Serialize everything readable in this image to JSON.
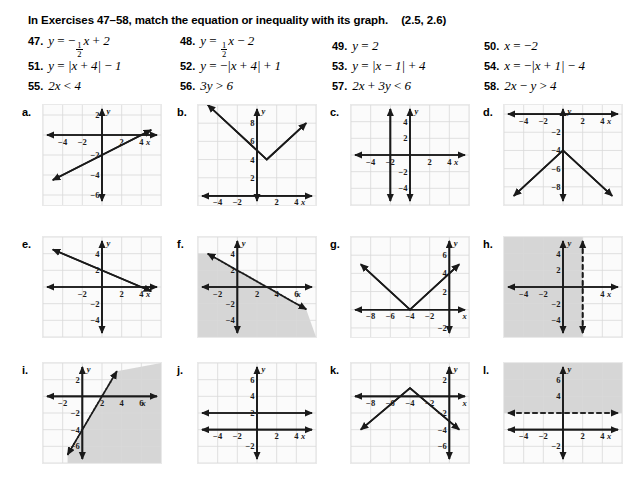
{
  "directions": {
    "text": "In Exercises 47–58, match the equation or inequality with its graph.",
    "reference": "(2.5, 2.6)"
  },
  "exercises": [
    {
      "number": "47.",
      "equation": "y = -(1/2)x + 2",
      "parts": [
        "y",
        "=",
        "-",
        "1/2",
        "x",
        "+",
        "2"
      ]
    },
    {
      "number": "48.",
      "equation": "y = (1/2)x - 2",
      "parts": [
        "y",
        "=",
        "1/2",
        "x",
        "-",
        "2"
      ]
    },
    {
      "number": "49.",
      "equation": "y = 2"
    },
    {
      "number": "50.",
      "equation": "x = -2"
    },
    {
      "number": "51.",
      "equation": "y = |x + 4| - 1"
    },
    {
      "number": "52.",
      "equation": "y = -|x + 4| + 1"
    },
    {
      "number": "53.",
      "equation": "y = |x - 1| + 4"
    },
    {
      "number": "54.",
      "equation": "x = -|x + 1| - 4"
    },
    {
      "number": "55.",
      "equation": "2x < 4"
    },
    {
      "number": "56.",
      "equation": "3y > 6"
    },
    {
      "number": "57.",
      "equation": "2x + 3y < 6"
    },
    {
      "number": "58.",
      "equation": "2x - y > 4"
    }
  ],
  "chart_data": [
    {
      "id": "a",
      "label": "a.",
      "type": "line",
      "title": "",
      "xlabel": "x",
      "ylabel": "y",
      "grid": true,
      "legend": "none",
      "xlim": [
        -6,
        6
      ],
      "ylim": [
        -7,
        3
      ],
      "xticks": [
        -4,
        -2,
        2,
        4
      ],
      "yticks": [
        2,
        -2,
        -4,
        -6
      ],
      "series": [
        {
          "name": "y = (1/2)x - 2",
          "style": "solid",
          "points": [
            [
              -5,
              -4.5
            ],
            [
              5,
              0.5
            ]
          ]
        }
      ]
    },
    {
      "id": "b",
      "label": "b.",
      "type": "line",
      "title": "",
      "xlabel": "x",
      "ylabel": "y",
      "grid": true,
      "legend": "none",
      "xlim": [
        -6,
        6
      ],
      "ylim": [
        -1,
        10
      ],
      "xticks": [
        -4,
        -2,
        2,
        4
      ],
      "yticks": [
        8,
        6,
        4,
        2
      ],
      "series": [
        {
          "name": "y = |x - 1| + 4",
          "style": "solid",
          "vertex": [
            1,
            4
          ],
          "points": [
            [
              -5,
              10
            ],
            [
              1,
              4
            ],
            [
              5,
              8
            ]
          ]
        }
      ]
    },
    {
      "id": "c",
      "label": "c.",
      "type": "line",
      "title": "",
      "xlabel": "x",
      "ylabel": "y",
      "grid": true,
      "legend": "none",
      "xlim": [
        -6,
        6
      ],
      "ylim": [
        -6,
        6
      ],
      "xticks": [
        -4,
        -2,
        2,
        4
      ],
      "yticks": [
        4,
        2,
        -2,
        -4
      ],
      "series": [
        {
          "name": "x = -2",
          "style": "solid",
          "vertical": -2
        }
      ]
    },
    {
      "id": "d",
      "label": "d.",
      "type": "line",
      "title": "",
      "xlabel": "x",
      "ylabel": "y",
      "grid": true,
      "legend": "none",
      "xlim": [
        -6,
        6
      ],
      "ylim": [
        -10,
        1
      ],
      "xticks": [
        -4,
        -2,
        2,
        4
      ],
      "yticks": [
        -2,
        -4,
        -6,
        -8
      ],
      "series": [
        {
          "name": "y = -|x| - 4",
          "style": "solid",
          "vertex": [
            0,
            -4
          ],
          "points": [
            [
              -5,
              -9
            ],
            [
              0,
              -4
            ],
            [
              5,
              -9
            ]
          ]
        }
      ]
    },
    {
      "id": "e",
      "label": "e.",
      "type": "line",
      "title": "",
      "xlabel": "x",
      "ylabel": "y",
      "grid": true,
      "legend": "none",
      "xlim": [
        -6,
        6
      ],
      "ylim": [
        -6,
        6
      ],
      "xticks": [
        -2,
        2,
        4
      ],
      "yticks": [
        4,
        2,
        -2,
        -4
      ],
      "series": [
        {
          "name": "y = -(1/2)x + 2",
          "style": "solid",
          "points": [
            [
              -5,
              4.5
            ],
            [
              5,
              -0.5
            ]
          ]
        }
      ]
    },
    {
      "id": "f",
      "label": "f.",
      "type": "area",
      "title": "",
      "xlabel": "x",
      "ylabel": "y",
      "grid": true,
      "legend": "none",
      "xlim": [
        -4,
        8
      ],
      "ylim": [
        -6,
        6
      ],
      "xticks": [
        -2,
        2,
        4,
        6
      ],
      "yticks": [
        4,
        2,
        -2,
        -4
      ],
      "series": [
        {
          "name": "2x + 3y < 6",
          "style": "dashed",
          "shade": "below-left",
          "points": [
            [
              -3,
              4
            ],
            [
              3,
              0
            ],
            [
              7,
              -2.67
            ]
          ]
        }
      ]
    },
    {
      "id": "g",
      "label": "g.",
      "type": "line",
      "title": "",
      "xlabel": "x",
      "ylabel": "y",
      "grid": true,
      "legend": "none",
      "xlim": [
        -10,
        2
      ],
      "ylim": [
        -3,
        8
      ],
      "xticks": [
        -8,
        -6,
        -4,
        -2
      ],
      "yticks": [
        6,
        4,
        2,
        -2
      ],
      "series": [
        {
          "name": "y = |x + 4|",
          "style": "solid",
          "vertex": [
            -4,
            0
          ],
          "points": [
            [
              -9,
              5
            ],
            [
              -4,
              0
            ],
            [
              1,
              5
            ]
          ]
        }
      ]
    },
    {
      "id": "h",
      "label": "h.",
      "type": "area",
      "title": "",
      "xlabel": "x",
      "ylabel": "y",
      "grid": true,
      "legend": "none",
      "xlim": [
        -6,
        6
      ],
      "ylim": [
        -6,
        6
      ],
      "xticks": [
        -4,
        -2,
        4
      ],
      "yticks": [
        4,
        2,
        -2,
        -4
      ],
      "series": [
        {
          "name": "2x < 4",
          "style": "dashed",
          "vertical": 2,
          "shade": "left"
        }
      ]
    },
    {
      "id": "i",
      "label": "i.",
      "type": "area",
      "title": "",
      "xlabel": "x",
      "ylabel": "y",
      "grid": true,
      "legend": "none",
      "xlim": [
        -4,
        8
      ],
      "ylim": [
        -8,
        4
      ],
      "xticks": [
        -2,
        2,
        4,
        6
      ],
      "yticks": [
        2,
        -2,
        -4,
        -6
      ],
      "series": [
        {
          "name": "2x - y > 4",
          "style": "dashed",
          "shade": "right",
          "points": [
            [
              -1.5,
              -7
            ],
            [
              2,
              0
            ],
            [
              3.5,
              3
            ]
          ]
        }
      ]
    },
    {
      "id": "j",
      "label": "j.",
      "type": "line",
      "title": "",
      "xlabel": "x",
      "ylabel": "y",
      "grid": true,
      "legend": "none",
      "xlim": [
        -6,
        6
      ],
      "ylim": [
        -4,
        8
      ],
      "xticks": [
        -4,
        -2,
        2,
        4
      ],
      "yticks": [
        6,
        4,
        2,
        -2
      ],
      "series": [
        {
          "name": "y = 2",
          "style": "solid",
          "horizontal": 2
        }
      ]
    },
    {
      "id": "k",
      "label": "k.",
      "type": "line",
      "title": "",
      "xlabel": "x",
      "ylabel": "y",
      "grid": true,
      "legend": "none",
      "xlim": [
        -10,
        2
      ],
      "ylim": [
        -8,
        4
      ],
      "xticks": [
        -8,
        -6,
        -4,
        -2
      ],
      "yticks": [
        2,
        -2,
        -4,
        -6
      ],
      "series": [
        {
          "name": "y = -|x + 4| + 1",
          "style": "solid",
          "vertex": [
            -4,
            1
          ],
          "points": [
            [
              -9,
              -4
            ],
            [
              -4,
              1
            ],
            [
              1,
              -4
            ]
          ]
        }
      ]
    },
    {
      "id": "l",
      "label": "l.",
      "type": "area",
      "title": "",
      "xlabel": "x",
      "ylabel": "y",
      "grid": true,
      "legend": "none",
      "xlim": [
        -6,
        6
      ],
      "ylim": [
        -4,
        8
      ],
      "xticks": [
        -4,
        -2,
        2,
        4
      ],
      "yticks": [
        6,
        4,
        -2
      ],
      "series": [
        {
          "name": "3y > 6",
          "style": "dashed",
          "horizontal": 2,
          "shade": "above"
        }
      ]
    }
  ],
  "colors": {
    "ink": "#1a1a1a",
    "grid": "#d9d9d9",
    "panel_bg": "#fbfbfb",
    "shade": "#c9c9c9"
  }
}
